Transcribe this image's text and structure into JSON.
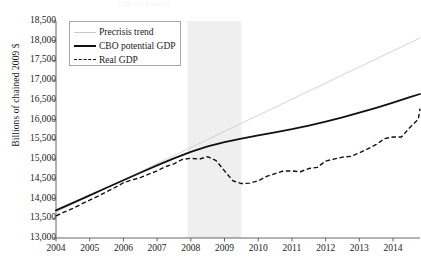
{
  "figure": {
    "ghost_title": "GDP and Potential",
    "background": "#ffffff",
    "ink_color": "#111111"
  },
  "legend": {
    "position": "top-left-inside",
    "border_color": "#a6a6a6",
    "entries": [
      {
        "label": "Precrisis trend",
        "style": "solid-thin",
        "color": "#c9c9c9"
      },
      {
        "label": "CBO potential GDP",
        "style": "solid-thick",
        "color": "#111111"
      },
      {
        "label": "Real GDP",
        "style": "dashed",
        "color": "#111111"
      }
    ]
  },
  "axes": {
    "ylabel": "Billions of chained 2009 $",
    "xlabel": "",
    "yticks": [
      "18,500",
      "18,000",
      "17,500",
      "17,000",
      "16,500",
      "16,000",
      "15,500",
      "15,000",
      "14,500",
      "14,000",
      "13,500",
      "13,000"
    ],
    "xticks": [
      "2004",
      "2005",
      "2006",
      "2007",
      "2008",
      "2009",
      "2010",
      "2011",
      "2012",
      "2013",
      "2014"
    ]
  },
  "annotations": {
    "recession_band": {
      "label": "recession shading",
      "start": 2007.9,
      "end": 2009.5,
      "color": "#efefef"
    }
  },
  "chart_data": {
    "type": "line",
    "title": "",
    "xlabel": "",
    "ylabel": "Billions of chained 2009 $",
    "xlim": [
      2004,
      2014.8
    ],
    "ylim": [
      13000,
      18500
    ],
    "ytick_step": 500,
    "grid": false,
    "legend_position": "upper left",
    "shaded_region": {
      "x0": 2007.9,
      "x1": 2009.5,
      "color": "#efefef"
    },
    "series": [
      {
        "name": "Precrisis trend",
        "style": "solid",
        "width": 0.8,
        "color": "#c9c9c9",
        "points": [
          [
            2004.0,
            13660
          ],
          [
            2014.8,
            18070
          ]
        ]
      },
      {
        "name": "CBO potential GDP",
        "style": "solid",
        "width": 1.8,
        "color": "#111111",
        "points": [
          [
            2004.0,
            13700
          ],
          [
            2004.5,
            13890
          ],
          [
            2005.0,
            14080
          ],
          [
            2005.5,
            14275
          ],
          [
            2006.0,
            14465
          ],
          [
            2006.5,
            14655
          ],
          [
            2007.0,
            14840
          ],
          [
            2007.5,
            15020
          ],
          [
            2008.0,
            15185
          ],
          [
            2008.5,
            15320
          ],
          [
            2009.0,
            15430
          ],
          [
            2009.5,
            15520
          ],
          [
            2010.0,
            15600
          ],
          [
            2010.5,
            15680
          ],
          [
            2011.0,
            15760
          ],
          [
            2011.5,
            15850
          ],
          [
            2012.0,
            15950
          ],
          [
            2012.5,
            16060
          ],
          [
            2013.0,
            16180
          ],
          [
            2013.5,
            16300
          ],
          [
            2014.0,
            16430
          ],
          [
            2014.5,
            16570
          ],
          [
            2014.8,
            16650
          ]
        ]
      },
      {
        "name": "Real GDP",
        "style": "dashed",
        "width": 1.4,
        "color": "#111111",
        "points": [
          [
            2004.0,
            13560
          ],
          [
            2004.25,
            13660
          ],
          [
            2004.5,
            13750
          ],
          [
            2004.75,
            13860
          ],
          [
            2005.0,
            13960
          ],
          [
            2005.25,
            14060
          ],
          [
            2005.5,
            14170
          ],
          [
            2005.75,
            14280
          ],
          [
            2006.0,
            14400
          ],
          [
            2006.25,
            14470
          ],
          [
            2006.5,
            14530
          ],
          [
            2006.75,
            14620
          ],
          [
            2007.0,
            14700
          ],
          [
            2007.25,
            14810
          ],
          [
            2007.5,
            14880
          ],
          [
            2007.75,
            14990
          ],
          [
            2008.0,
            15020
          ],
          [
            2008.25,
            15000
          ],
          [
            2008.5,
            15060
          ],
          [
            2008.75,
            14960
          ],
          [
            2009.0,
            14700
          ],
          [
            2009.25,
            14450
          ],
          [
            2009.5,
            14380
          ],
          [
            2009.75,
            14390
          ],
          [
            2010.0,
            14450
          ],
          [
            2010.25,
            14560
          ],
          [
            2010.5,
            14630
          ],
          [
            2010.75,
            14700
          ],
          [
            2011.0,
            14700
          ],
          [
            2011.25,
            14680
          ],
          [
            2011.5,
            14760
          ],
          [
            2011.75,
            14790
          ],
          [
            2012.0,
            14950
          ],
          [
            2012.25,
            15000
          ],
          [
            2012.5,
            15050
          ],
          [
            2012.75,
            15070
          ],
          [
            2013.0,
            15160
          ],
          [
            2013.25,
            15260
          ],
          [
            2013.5,
            15370
          ],
          [
            2013.75,
            15520
          ],
          [
            2014.0,
            15560
          ],
          [
            2014.25,
            15560
          ],
          [
            2014.5,
            15800
          ],
          [
            2014.75,
            16010
          ],
          [
            2014.8,
            16280
          ]
        ]
      }
    ]
  }
}
